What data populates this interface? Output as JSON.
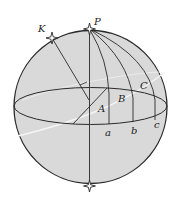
{
  "diagram": {
    "type": "celestial-sphere",
    "labels": {
      "K": "K",
      "P": "P",
      "A": "A",
      "B": "B",
      "C": "C",
      "a": "a",
      "b": "b",
      "c": "c"
    },
    "colors": {
      "sphere_fill": "#d9d9d9",
      "line": "#2a2a2a",
      "highlight_circle": "#f5f5f5",
      "background": "#ffffff"
    }
  }
}
